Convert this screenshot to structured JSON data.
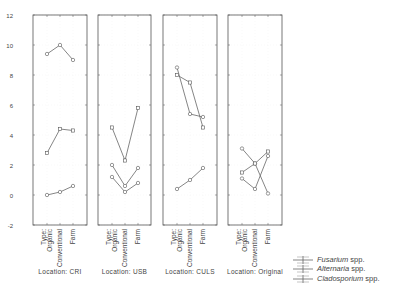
{
  "chart_data": {
    "type": "line",
    "title": "",
    "ylabel": "",
    "ylim": [
      -2,
      12
    ],
    "yticks": [
      -2,
      0,
      2,
      4,
      6,
      8,
      10,
      12
    ],
    "categories": [
      "Type: Organic",
      "Conventional",
      "Farm"
    ],
    "category_labels": [
      [
        "Type:",
        "Organic"
      ],
      [
        "Conventional"
      ],
      [
        "Farm"
      ]
    ],
    "legend": [
      {
        "name": "Fusarium",
        "suffix": " spp.",
        "marker": "circle"
      },
      {
        "name": "Alternaria",
        "suffix": " spp.",
        "marker": "square"
      },
      {
        "name": "Cladosporium",
        "suffix": " spp.",
        "marker": "circle"
      }
    ],
    "panels": [
      {
        "label": "Location: CRI",
        "series": [
          {
            "name": "Fusarium spp.",
            "marker": "circle",
            "values": [
              9.4,
              10.0,
              9.0
            ]
          },
          {
            "name": "Alternaria spp.",
            "marker": "square",
            "values": [
              2.8,
              4.4,
              4.3
            ]
          },
          {
            "name": "Cladosporium spp.",
            "marker": "circle",
            "values": [
              0.0,
              0.2,
              0.6
            ]
          }
        ]
      },
      {
        "label": "Location: USB",
        "series": [
          {
            "name": "Fusarium spp.",
            "marker": "circle",
            "values": [
              2.0,
              0.6,
              1.8
            ]
          },
          {
            "name": "Alternaria spp.",
            "marker": "square",
            "values": [
              4.5,
              2.3,
              5.8
            ]
          },
          {
            "name": "Cladosporium spp.",
            "marker": "circle",
            "values": [
              1.2,
              0.2,
              0.8
            ]
          }
        ]
      },
      {
        "label": "Location: CULS",
        "series": [
          {
            "name": "Fusarium spp.",
            "marker": "circle",
            "values": [
              8.5,
              5.4,
              5.2
            ]
          },
          {
            "name": "Alternaria spp.",
            "marker": "square",
            "values": [
              8.0,
              7.5,
              4.5
            ]
          },
          {
            "name": "Cladosporium spp.",
            "marker": "circle",
            "values": [
              0.4,
              1.0,
              1.8
            ]
          }
        ]
      },
      {
        "label": "Location: Original",
        "series": [
          {
            "name": "Fusarium spp.",
            "marker": "circle",
            "values": [
              3.1,
              2.1,
              0.1
            ]
          },
          {
            "name": "Alternaria spp.",
            "marker": "square",
            "values": [
              1.5,
              2.1,
              2.9
            ]
          },
          {
            "name": "Cladosporium spp.",
            "marker": "circle",
            "values": [
              1.1,
              0.4,
              2.6
            ]
          }
        ]
      }
    ]
  }
}
